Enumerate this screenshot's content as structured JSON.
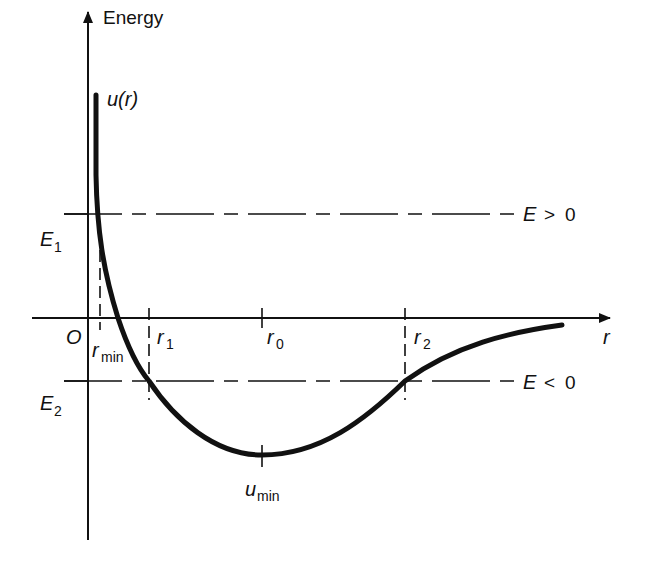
{
  "diagram": {
    "type": "potential-energy-curve",
    "y_axis_label": "Energy",
    "x_axis_label": "r",
    "origin_label": "O",
    "curve_label": "u(r)",
    "curve_label_main": "u",
    "curve_label_arg": "(r)",
    "levels": [
      {
        "name": "E1",
        "main": "E",
        "sub": "1",
        "line_label": "E > 0",
        "line_label_main": "E",
        "line_label_rel": ">",
        "line_label_val": "0"
      },
      {
        "name": "E2",
        "main": "E",
        "sub": "2",
        "line_label": "E < 0",
        "line_label_main": "E",
        "line_label_rel": "<",
        "line_label_val": "0"
      }
    ],
    "x_markers": [
      {
        "name": "r_min",
        "main": "r",
        "sub": "min"
      },
      {
        "name": "r_1",
        "main": "r",
        "sub": "1"
      },
      {
        "name": "r_0",
        "main": "r",
        "sub": "0"
      },
      {
        "name": "r_2",
        "main": "r",
        "sub": "2"
      }
    ],
    "minimum_label": "u_min",
    "minimum_label_main": "u",
    "minimum_label_sub": "min",
    "colors": {
      "ink": "#111111",
      "background": "#ffffff"
    }
  }
}
